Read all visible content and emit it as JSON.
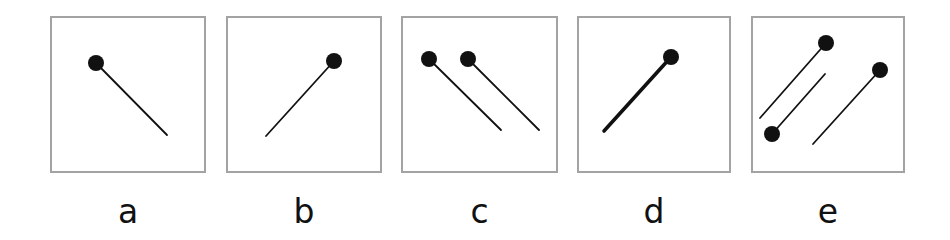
{
  "figure": {
    "panels": [
      {
        "id": "a",
        "label": "a",
        "box": {
          "x": 50,
          "y": 16,
          "w": 156,
          "h": 157
        },
        "pins": [
          {
            "head": [
              46,
              47
            ],
            "tail": [
              117,
              119
            ],
            "stroke": 1.8
          }
        ]
      },
      {
        "id": "b",
        "label": "b",
        "box": {
          "x": 226,
          "y": 16,
          "w": 156,
          "h": 157
        },
        "pins": [
          {
            "head": [
              108,
              45
            ],
            "tail": [
              40,
              120
            ],
            "stroke": 1.8
          }
        ]
      },
      {
        "id": "c",
        "label": "c",
        "box": {
          "x": 401,
          "y": 16,
          "w": 157,
          "h": 157
        },
        "pins": [
          {
            "head": [
              28,
              43
            ],
            "tail": [
              100,
              114
            ],
            "stroke": 1.8
          },
          {
            "head": [
              67,
              43
            ],
            "tail": [
              138,
              114
            ],
            "stroke": 1.8
          }
        ]
      },
      {
        "id": "d",
        "label": "d",
        "box": {
          "x": 577,
          "y": 16,
          "w": 154,
          "h": 157
        },
        "pins": [
          {
            "head": [
              94,
              41
            ],
            "tail": [
              27,
              115
            ],
            "stroke": 3.6
          }
        ]
      },
      {
        "id": "e",
        "label": "e",
        "box": {
          "x": 751,
          "y": 16,
          "w": 154,
          "h": 157
        },
        "pins": [
          {
            "head": [
              75,
              27
            ],
            "tail": [
              9,
              102
            ],
            "stroke": 1.8
          },
          {
            "head": [
              21,
              118
            ],
            "tail": [
              74,
              58
            ],
            "stroke": 1.8
          },
          {
            "head": [
              129,
              54
            ],
            "tail": [
              62,
              128
            ],
            "stroke": 1.8
          }
        ]
      }
    ],
    "colors": {
      "border": "#a3a3a3",
      "ink": "#111111",
      "background": "#ffffff"
    },
    "pin_head_radius": 8
  }
}
